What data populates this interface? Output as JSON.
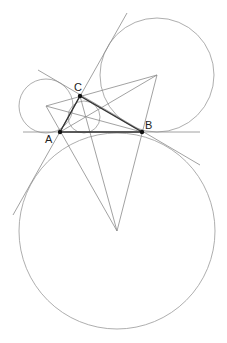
{
  "diagram": {
    "title": "",
    "points": {
      "A": {
        "label": "A",
        "x": 60,
        "y": 132
      },
      "B": {
        "label": "B",
        "x": 142,
        "y": 132
      },
      "C": {
        "label": "C",
        "x": 80,
        "y": 96
      }
    },
    "excenters": {
      "Ia": {
        "x": 46,
        "y": 106,
        "r": 27
      },
      "Ic": {
        "x": 157,
        "y": 75,
        "r": 57
      },
      "Ib": {
        "x": 117,
        "y": 231,
        "r": 98
      }
    },
    "incircle": {
      "x": 84,
      "y": 117,
      "r": 16
    },
    "colors": {
      "lines": "#8a8a8a",
      "circles": "#999999",
      "triangle": "#333333",
      "points": "#111111"
    }
  }
}
